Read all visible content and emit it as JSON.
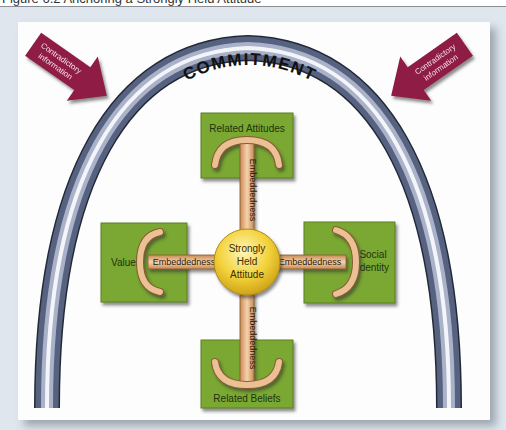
{
  "figure": {
    "caption": "Figure 6.2  Anchoring a Strongly Held Attitude"
  },
  "arch": {
    "label": "COMMITMENT",
    "color_outer": "#4d5a78",
    "color_highlight": "#f4f6fb"
  },
  "pressures": {
    "left": {
      "line1": "Contradictory",
      "line2": "information"
    },
    "right": {
      "line1": "Contradictory",
      "line2": "information"
    },
    "color": "#8e1a45"
  },
  "center": {
    "line1": "Strongly",
    "line2": "Held",
    "line3": "Attitude",
    "color": "#f2d23a"
  },
  "anchors": {
    "top": {
      "box_label": "Related Attitudes",
      "shaft_label": "Embeddedness"
    },
    "left": {
      "box_label": "Values",
      "shaft_label": "Embeddedness"
    },
    "right": {
      "box_label_line1": "Social",
      "box_label_line2": "Identity",
      "shaft_label": "Embeddedness"
    },
    "bottom": {
      "box_label": "Related Beliefs",
      "shaft_label": "Embeddedness"
    }
  },
  "colors": {
    "box_green": "#7aa832",
    "anchor_tan": "#e9b98a",
    "frame_bg": "#dfe6ee"
  }
}
